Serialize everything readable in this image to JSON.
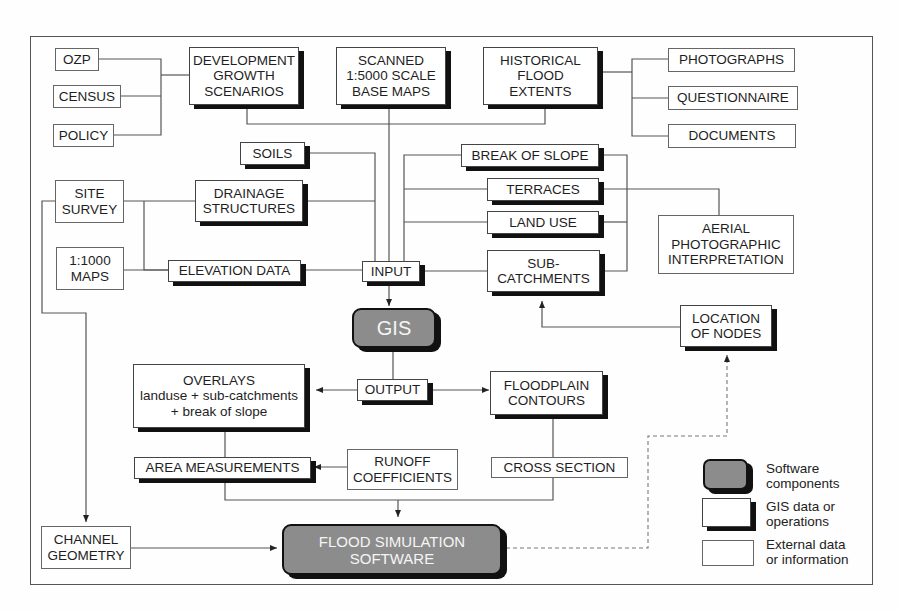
{
  "nodes": {
    "ozp": {
      "label": "OZP",
      "kind": "external"
    },
    "census": {
      "label": "CENSUS",
      "kind": "external"
    },
    "policy": {
      "label": "POLICY",
      "kind": "external"
    },
    "development": {
      "label": "DEVELOPMENT\nGROWTH\nSCENARIOS",
      "kind": "gis"
    },
    "scanned": {
      "label": "SCANNED\n1:5000 SCALE\nBASE MAPS",
      "kind": "gis"
    },
    "historical": {
      "label": "HISTORICAL\nFLOOD\nEXTENTS",
      "kind": "gis"
    },
    "photographs": {
      "label": "PHOTOGRAPHS",
      "kind": "external"
    },
    "questionnaire": {
      "label": "QUESTIONNAIRE",
      "kind": "external"
    },
    "documents": {
      "label": "DOCUMENTS",
      "kind": "external"
    },
    "soils": {
      "label": "SOILS",
      "kind": "gis"
    },
    "break_of_slope": {
      "label": "BREAK OF SLOPE",
      "kind": "gis"
    },
    "site_survey": {
      "label": "SITE\nSURVEY",
      "kind": "external"
    },
    "drainage": {
      "label": "DRAINAGE\nSTRUCTURES",
      "kind": "gis"
    },
    "terraces": {
      "label": "TERRACES",
      "kind": "gis"
    },
    "land_use": {
      "label": "LAND USE",
      "kind": "gis"
    },
    "aerial": {
      "label": "AERIAL\nPHOTOGRAPHIC\nINTERPRETATION",
      "kind": "external"
    },
    "maps_1000": {
      "label": "1:1000\nMAPS",
      "kind": "external"
    },
    "elevation": {
      "label": "ELEVATION DATA",
      "kind": "gis"
    },
    "input": {
      "label": "INPUT",
      "kind": "gis"
    },
    "sub_catchments": {
      "label": "SUB-\nCATCHMENTS",
      "kind": "gis"
    },
    "gis": {
      "label": "GIS",
      "kind": "software"
    },
    "location_of_nodes": {
      "label": "LOCATION\nOF NODES",
      "kind": "gis"
    },
    "overlays": {
      "label": "OVERLAYS\nlanduse + sub-catchments\n+ break of slope",
      "kind": "gis"
    },
    "output": {
      "label": "OUTPUT",
      "kind": "gis"
    },
    "floodplain": {
      "label": "FLOODPLAIN\nCONTOURS",
      "kind": "gis"
    },
    "area_measurements": {
      "label": "AREA MEASUREMENTS",
      "kind": "gis"
    },
    "runoff": {
      "label": "RUNOFF\nCOEFFICIENTS",
      "kind": "external"
    },
    "cross_section": {
      "label": "CROSS SECTION",
      "kind": "external"
    },
    "channel_geometry": {
      "label": "CHANNEL\nGEOMETRY",
      "kind": "external"
    },
    "flood_sim": {
      "label": "FLOOD SIMULATION\nSOFTWARE",
      "kind": "software"
    }
  },
  "edges": [
    {
      "from": "ozp",
      "to": "development"
    },
    {
      "from": "census",
      "to": "development"
    },
    {
      "from": "policy",
      "to": "development"
    },
    {
      "from": "photographs",
      "to": "historical"
    },
    {
      "from": "questionnaire",
      "to": "historical"
    },
    {
      "from": "documents",
      "to": "historical"
    },
    {
      "from": "development",
      "to": "input"
    },
    {
      "from": "scanned",
      "to": "input"
    },
    {
      "from": "historical",
      "to": "input"
    },
    {
      "from": "soils",
      "to": "input"
    },
    {
      "from": "drainage",
      "to": "input"
    },
    {
      "from": "site_survey",
      "to": "drainage"
    },
    {
      "from": "site_survey",
      "to": "elevation"
    },
    {
      "from": "maps_1000",
      "to": "elevation"
    },
    {
      "from": "elevation",
      "to": "input"
    },
    {
      "from": "break_of_slope",
      "to": "input"
    },
    {
      "from": "terraces",
      "to": "input"
    },
    {
      "from": "land_use",
      "to": "input"
    },
    {
      "from": "sub_catchments",
      "to": "input"
    },
    {
      "from": "aerial",
      "to": "terraces"
    },
    {
      "from": "input",
      "to": "gis",
      "arrow": true
    },
    {
      "from": "gis",
      "to": "output"
    },
    {
      "from": "output",
      "to": "overlays",
      "arrow": true
    },
    {
      "from": "output",
      "to": "floodplain",
      "arrow": true
    },
    {
      "from": "location_of_nodes",
      "to": "sub_catchments",
      "arrow": true
    },
    {
      "from": "overlays",
      "to": "area_measurements"
    },
    {
      "from": "runoff",
      "to": "area_measurements",
      "arrow": true
    },
    {
      "from": "floodplain",
      "to": "cross_section"
    },
    {
      "from": "area_measurements",
      "to": "flood_sim",
      "arrow": true
    },
    {
      "from": "cross_section",
      "to": "flood_sim",
      "arrow": true
    },
    {
      "from": "site_survey",
      "to": "channel_geometry",
      "arrow": true
    },
    {
      "from": "channel_geometry",
      "to": "flood_sim",
      "arrow": true
    },
    {
      "from": "flood_sim",
      "to": "location_of_nodes",
      "arrow": true,
      "style": "dashed"
    }
  ],
  "legend": {
    "software": "Software\ncomponents",
    "gis": "GIS data or\noperations",
    "external": "External data\nor information"
  },
  "colors": {
    "software_fill": "#8c8c8c",
    "shadow": "#111111",
    "line": "#555555"
  }
}
